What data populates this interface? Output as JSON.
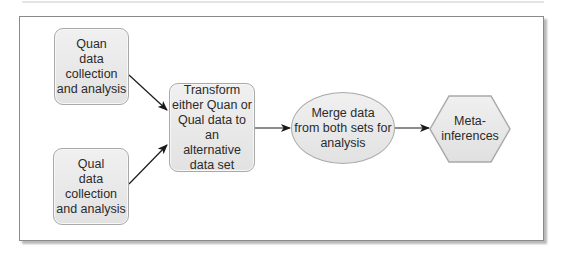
{
  "diagram": {
    "type": "flowchart",
    "nodes": {
      "quan": {
        "label": "Quan data collection and analysis",
        "lines": [
          "Quan",
          "data",
          "collection",
          "and analysis"
        ],
        "shape": "rounded-rectangle"
      },
      "qual": {
        "label": "Qual data collection and analysis",
        "lines": [
          "Qual",
          "data",
          "collection",
          "and analysis"
        ],
        "shape": "rounded-rectangle"
      },
      "transform": {
        "label": "Transform either Quan or Qual data to an alternative data set",
        "lines": [
          "Transform",
          "either Quan or",
          "Qual data to an",
          "alternative",
          "data set"
        ],
        "shape": "rounded-rectangle"
      },
      "merge": {
        "label": "Merge data from both sets for analysis",
        "lines": [
          "Merge data",
          "from both sets for",
          "analysis"
        ],
        "shape": "ellipse"
      },
      "meta": {
        "label": "Meta-inferences",
        "lines": [
          "Meta-",
          "inferences"
        ],
        "shape": "hexagon"
      }
    },
    "edges": [
      {
        "from": "quan",
        "to": "transform"
      },
      {
        "from": "qual",
        "to": "transform"
      },
      {
        "from": "transform",
        "to": "merge"
      },
      {
        "from": "merge",
        "to": "meta"
      }
    ],
    "colors": {
      "node_fill": "#e8e8e8",
      "node_border": "#a9a9a9",
      "arrow": "#1a1a1a",
      "frame_border": "#8a8a8a"
    }
  }
}
